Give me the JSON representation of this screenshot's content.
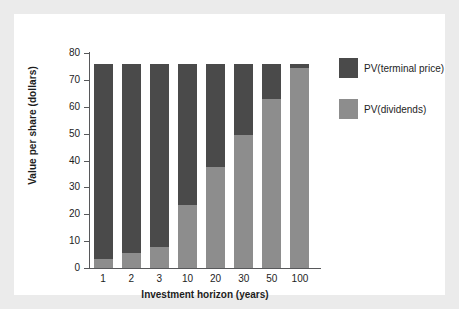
{
  "chart_data": {
    "type": "bar",
    "subtype": "stacked-vertical",
    "title": "",
    "subtitle": "",
    "xlabel": "Investment horizon (years)",
    "ylabel": "Value per share (dollars)",
    "categories": [
      "1",
      "2",
      "3",
      "10",
      "20",
      "30",
      "50",
      "100"
    ],
    "series": [
      {
        "name": "PV(dividends)",
        "color": "#8d8d8d",
        "values": [
          3.4,
          5.6,
          7.8,
          23.4,
          37.5,
          49.5,
          63.0,
          74.5
        ]
      },
      {
        "name": "PV(terminal price)",
        "color": "#4a4a4a",
        "values": [
          72.6,
          70.4,
          68.2,
          52.6,
          38.5,
          26.5,
          13.0,
          1.5
        ]
      }
    ],
    "totals": [
      76,
      76,
      76,
      76,
      76,
      76,
      76,
      76
    ],
    "ylim": [
      0,
      80
    ],
    "yticks": [
      0,
      10,
      20,
      30,
      40,
      50,
      60,
      70,
      80
    ],
    "ytick_labels": [
      "0",
      "10",
      "20",
      "30",
      "40",
      "50",
      "60",
      "70",
      "80"
    ],
    "grid": false,
    "legend_position": "right",
    "legend_order": [
      "PV(terminal price)",
      "PV(dividends)"
    ]
  },
  "legend": {
    "items": [
      {
        "label": "PV(terminal price)",
        "color": "#4a4a4a",
        "name": "terminal-price"
      },
      {
        "label": "PV(dividends)",
        "color": "#8d8d8d",
        "name": "dividends"
      }
    ]
  },
  "colors": {
    "terminal_price": "#4a4a4a",
    "dividends": "#8d8d8d",
    "axis": "#57585a",
    "text": "#1d1d1d",
    "plate_background": "#ffffff",
    "figure_background": "#ebebeb"
  }
}
